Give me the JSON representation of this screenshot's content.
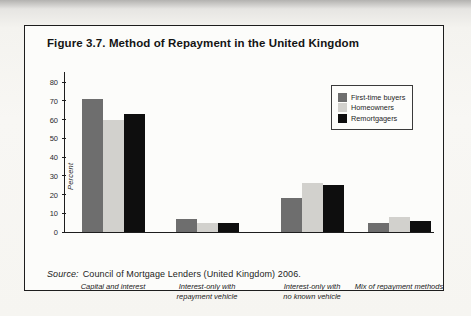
{
  "figure": {
    "title": "Figure 3.7. Method of Repayment in the United Kingdom",
    "source_prefix": "Source:",
    "source_rest": "Council of Mortgage Lenders (United Kingdom) 2006."
  },
  "chart_data": {
    "type": "bar",
    "title": "Figure 3.7. Method of Repayment in the United Kingdom",
    "xlabel": "",
    "ylabel": "Percent",
    "ylim": [
      0,
      80
    ],
    "yticks": [
      0,
      10,
      20,
      30,
      40,
      50,
      60,
      70,
      80
    ],
    "grid": false,
    "legend_position": "upper right",
    "categories": [
      "Capital and interest",
      "Interest-only with repayment vehicle",
      "Interest-only with no known vehicle",
      "Mix of repayment methods"
    ],
    "category_label_lines": [
      [
        "Capital and interest"
      ],
      [
        "Interest-only with",
        "repayment vehicle"
      ],
      [
        "Interest-only with",
        "no known vehicle"
      ],
      [
        "Mix of repayment methods"
      ]
    ],
    "series": [
      {
        "name": "First-time buyers",
        "color": "#6e6e6e",
        "values": [
          71,
          7,
          18,
          5
        ]
      },
      {
        "name": "Homeowners",
        "color": "#d2d1cd",
        "values": [
          60,
          5,
          26,
          8
        ]
      },
      {
        "name": "Remortgagers",
        "color": "#0e0e0e",
        "values": [
          63,
          5,
          25,
          6
        ]
      }
    ],
    "source": "Source: Council of Mortgage Lenders (United Kingdom) 2006."
  }
}
